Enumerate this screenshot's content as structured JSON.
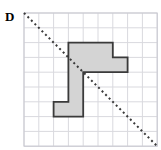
{
  "figure": {
    "label": "D",
    "type": "grid-polygon-with-line-of-symmetry",
    "grid": {
      "columns": 9,
      "rows": 9,
      "origin_x": 24,
      "origin_y": 13,
      "cell_size": 14.8,
      "line_color": "#d9d9de",
      "border_color": "#c8c8d0",
      "show_grid": true
    },
    "polygon": {
      "fill_color": "#d4d4d4",
      "stroke_color": "#3a3a3a",
      "stroke_width": 1.8,
      "vertices_cells": [
        [
          4,
          2
        ],
        [
          6,
          2
        ],
        [
          6,
          3
        ],
        [
          7,
          3
        ],
        [
          7,
          4
        ],
        [
          4,
          4
        ],
        [
          4,
          7
        ],
        [
          2,
          7
        ],
        [
          2,
          6
        ],
        [
          3,
          6
        ],
        [
          3,
          4
        ],
        [
          4,
          4
        ]
      ],
      "vertices_cells_simplified": [
        [
          4,
          2
        ],
        [
          6,
          2
        ],
        [
          6,
          3
        ],
        [
          7,
          3
        ],
        [
          7,
          4
        ],
        [
          4,
          4
        ],
        [
          4,
          7
        ],
        [
          2,
          7
        ],
        [
          2,
          6
        ],
        [
          3,
          6
        ],
        [
          3,
          2
        ]
      ]
    },
    "dashed_line": {
      "color": "#3a3a3a",
      "dash_pattern": "2 3",
      "stroke_width": 2,
      "from_cell": [
        0,
        0
      ],
      "to_cell": [
        9,
        9
      ],
      "description": "diagonal dashed line from top-left corner to bottom-right corner"
    }
  }
}
